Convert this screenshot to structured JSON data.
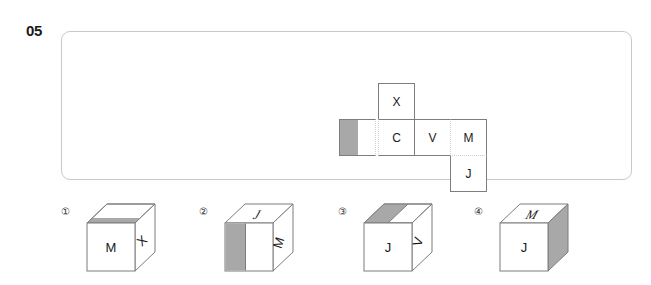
{
  "question": {
    "number": "05"
  },
  "net": {
    "label": "cube-net",
    "cells": [
      {
        "name": "cell-x",
        "letter": "X",
        "row": 0,
        "col": 1,
        "shaded": false
      },
      {
        "name": "cell-blank",
        "letter": "",
        "row": 1,
        "col": 0,
        "shaded": true
      },
      {
        "name": "cell-c",
        "letter": "C",
        "row": 1,
        "col": 1,
        "shaded": false
      },
      {
        "name": "cell-v",
        "letter": "V",
        "row": 1,
        "col": 2,
        "shaded": false
      },
      {
        "name": "cell-m",
        "letter": "M",
        "row": 1,
        "col": 3,
        "shaded": false
      },
      {
        "name": "cell-j",
        "letter": "J",
        "row": 2,
        "col": 3,
        "shaded": false
      }
    ]
  },
  "options": [
    {
      "number": "①",
      "name": "option-1",
      "front_letter": "M",
      "side_letter": "X",
      "top_letter": "",
      "shaded_face": "top",
      "shade_style": "band-front-edge"
    },
    {
      "number": "②",
      "name": "option-2",
      "front_letter": "",
      "side_letter": "M",
      "top_letter": "J",
      "shaded_face": "front",
      "shade_style": "band-left-half"
    },
    {
      "number": "③",
      "name": "option-3",
      "front_letter": "J",
      "side_letter": "V",
      "top_letter": "",
      "shaded_face": "top",
      "shade_style": "band-left-half"
    },
    {
      "number": "④",
      "name": "option-4",
      "front_letter": "J",
      "side_letter": "",
      "top_letter": "M",
      "shaded_face": "right",
      "shade_style": "full-face"
    }
  ],
  "colors": {
    "shade_gray": "#a8a8a8",
    "line": "#7d7d7d",
    "panel_border": "#c9c9c9",
    "text": "#1a1a1a",
    "faint_line": "#cfcfcf"
  }
}
